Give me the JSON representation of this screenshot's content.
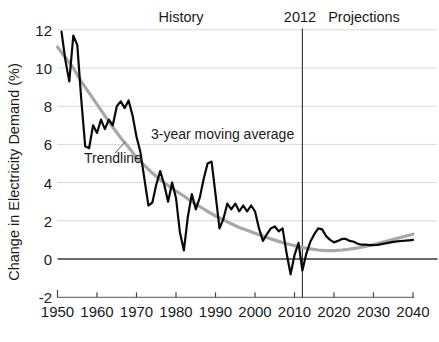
{
  "chart_data": {
    "type": "line",
    "title": "",
    "xlabel": "",
    "ylabel": "Change in Electricity Demand (%)",
    "xlim": [
      1950,
      2040
    ],
    "ylim": [
      -2,
      12
    ],
    "grid": "horizontal-light",
    "legend_position": "none",
    "regions": {
      "history_label": "History",
      "projections_label": "Projections"
    },
    "divider": {
      "label": "2012",
      "year": 2012
    },
    "x_ticks": [
      1950,
      1960,
      1970,
      1980,
      1990,
      2000,
      2010,
      2020,
      2030,
      2040
    ],
    "y_ticks": [
      12,
      10,
      8,
      6,
      4,
      2,
      0,
      -2
    ],
    "colors": {
      "moving_average_line": "#0a0a0a",
      "trendline": "#a8a8a8",
      "gridline": "#d8d8d8",
      "zero_line": "#3a3a3a",
      "divider_line": "#333333",
      "axis": "#777777",
      "text": "#1a1a1a"
    },
    "series": [
      {
        "name": "3-year moving average",
        "color": "#0a0a0a",
        "stroke_width": 2.2,
        "x_start": 1951,
        "x_step": 1,
        "values": [
          11.9,
          10.4,
          9.3,
          11.7,
          11.2,
          8.4,
          5.9,
          5.8,
          7.0,
          6.6,
          7.3,
          6.8,
          7.3,
          7.0,
          8.0,
          8.25,
          7.9,
          8.3,
          7.5,
          6.4,
          5.6,
          4.2,
          2.8,
          2.95,
          3.9,
          4.6,
          3.9,
          3.0,
          4.0,
          3.2,
          1.4,
          0.45,
          2.2,
          3.4,
          2.6,
          3.2,
          4.2,
          5.0,
          5.1,
          3.4,
          1.6,
          2.1,
          2.9,
          2.6,
          2.9,
          2.5,
          2.8,
          2.5,
          2.8,
          2.5,
          1.6,
          0.95,
          1.3,
          1.6,
          1.7,
          1.45,
          1.6,
          0.3,
          -0.8,
          0.2,
          0.85,
          -0.6,
          0.3,
          0.9,
          1.3,
          1.6,
          1.55,
          1.2,
          1.0,
          0.87,
          0.95,
          1.05,
          1.05,
          0.95,
          0.9,
          0.8,
          0.75,
          0.75,
          0.72,
          0.72,
          0.74,
          0.78,
          0.82,
          0.86,
          0.9,
          0.92,
          0.94,
          0.96,
          0.98,
          1.0
        ]
      },
      {
        "name": "Trendline",
        "color": "#a8a8a8",
        "stroke_width": 3.2,
        "x_start": 1950,
        "x_step": 2,
        "values": [
          11.1,
          10.55,
          10.0,
          9.3,
          8.7,
          8.1,
          7.5,
          6.9,
          6.35,
          5.85,
          5.3,
          4.9,
          4.5,
          4.15,
          3.85,
          3.55,
          3.3,
          3.0,
          2.75,
          2.5,
          2.25,
          2.05,
          1.85,
          1.65,
          1.5,
          1.35,
          1.2,
          1.05,
          0.92,
          0.8,
          0.7,
          0.6,
          0.53,
          0.47,
          0.44,
          0.44,
          0.47,
          0.52,
          0.58,
          0.66,
          0.76,
          0.86,
          0.97,
          1.08,
          1.19,
          1.3
        ]
      }
    ]
  }
}
